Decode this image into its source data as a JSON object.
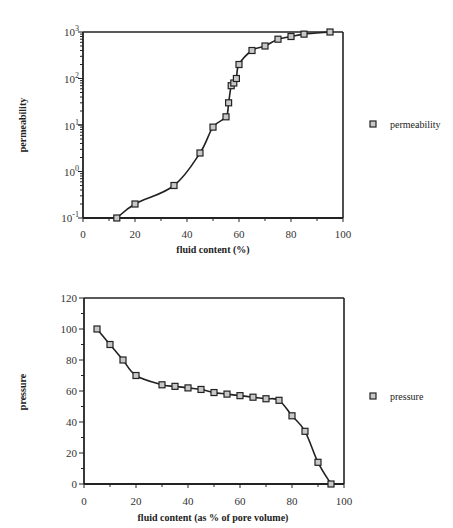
{
  "chart_data": [
    {
      "type": "line",
      "title": "",
      "xlabel": "fluid content  (%)",
      "ylabel": "permeability",
      "yscale": "log",
      "xlim": [
        0,
        100
      ],
      "ylim": [
        0.1,
        1000
      ],
      "x_ticks": [
        "0",
        "20",
        "40",
        "60",
        "80",
        "100"
      ],
      "y_ticks": [
        {
          "base": "10",
          "exp": "3"
        },
        {
          "base": "10",
          "exp": "2"
        },
        {
          "base": "10",
          "exp": "1"
        },
        {
          "base": "10",
          "exp": "0"
        },
        {
          "base": "10",
          "exp": "-1"
        }
      ],
      "grid": false,
      "legend_position": "right",
      "series": [
        {
          "name": "permeability",
          "x": [
            13,
            20,
            35,
            45,
            50,
            55,
            56,
            57,
            58,
            59,
            60,
            65,
            70,
            75,
            80,
            85,
            95
          ],
          "y": [
            0.1,
            0.2,
            0.5,
            2.5,
            9,
            15,
            30,
            70,
            80,
            100,
            200,
            400,
            500,
            700,
            800,
            900,
            1000
          ]
        }
      ]
    },
    {
      "type": "line",
      "title": "",
      "xlabel": "fluid content (as % of pore volume)",
      "ylabel": "pressure",
      "xlim": [
        0,
        100
      ],
      "ylim": [
        0,
        120
      ],
      "x_ticks": [
        "0",
        "20",
        "40",
        "60",
        "80",
        "100"
      ],
      "y_ticks": [
        "120",
        "100",
        "80",
        "60",
        "40",
        "20",
        "0"
      ],
      "grid": false,
      "legend_position": "right",
      "series": [
        {
          "name": "pressure",
          "x": [
            5,
            10,
            15,
            20,
            30,
            35,
            40,
            45,
            50,
            55,
            60,
            65,
            70,
            75,
            80,
            85,
            90,
            95
          ],
          "y": [
            100,
            90,
            80,
            70,
            64,
            63,
            62,
            61,
            59,
            58,
            57,
            56,
            55,
            54,
            44,
            34,
            14,
            0
          ]
        }
      ]
    }
  ],
  "charts": {
    "top": {
      "ylabel": "permeability",
      "xlabel": "fluid content  (%)",
      "legend": "permeability",
      "x_ticks": [
        "0",
        "20",
        "40",
        "60",
        "80",
        "100"
      ],
      "y_ticks": [
        "10",
        "10",
        "10",
        "10",
        "10"
      ],
      "y_exps": [
        "3",
        "2",
        "1",
        "0",
        "-1"
      ]
    },
    "bottom": {
      "ylabel": "pressure",
      "xlabel": "fluid content (as % of pore volume)",
      "legend": "pressure",
      "x_ticks": [
        "0",
        "20",
        "40",
        "60",
        "80",
        "100"
      ],
      "y_ticks": [
        "120",
        "100",
        "80",
        "60",
        "40",
        "20",
        "0"
      ]
    }
  },
  "colors": {
    "line": "#222222",
    "marker_fill": "#c8c8c8",
    "axis": "#222222"
  }
}
